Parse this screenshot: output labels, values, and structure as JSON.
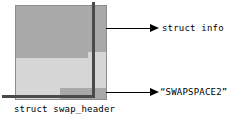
{
  "figure": {
    "name": "swap-header-layout-diagram",
    "caption": "struct swap_header",
    "block": {
      "regions": [
        {
          "id": "info",
          "label": "struct info",
          "fill": "#a9a9a9"
        },
        {
          "id": "body",
          "label": "",
          "fill": "#d6d6d6"
        },
        {
          "id": "swapspace",
          "label": "“SWAPSPACE2”",
          "fill": "#a9a9a9"
        }
      ],
      "outline_color": "#8d8d8d",
      "edge_color": "#4a4a4a"
    },
    "annotations": [
      {
        "id": "info-annotation",
        "text": "struct info"
      },
      {
        "id": "swapspace-annotation",
        "text": "“SWAPSPACE2”"
      }
    ],
    "colors": {
      "background": "#ffffff",
      "dark_gray": "#a9a9a9",
      "light_gray": "#d6d6d6",
      "edge": "#4a4a4a",
      "ink": "#000000"
    }
  }
}
